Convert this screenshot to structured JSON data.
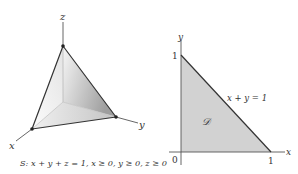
{
  "left_panel": {
    "axis_labels": {
      "x": "x",
      "y": "y",
      "z": "z"
    },
    "caption": "S: x + y + z = 1, x ≥ 0, y ≥ 0, z ≥ 0",
    "surface_name": "S",
    "vertices": {
      "origin": [
        63,
        102
      ],
      "top": [
        63,
        46
      ],
      "x_vertex": [
        32,
        129
      ],
      "y_vertex": [
        116,
        117
      ]
    }
  },
  "right_panel": {
    "axis_labels": {
      "x": "x",
      "y": "y"
    },
    "tick_labels": {
      "origin": "0",
      "x_one": "1",
      "y_one": "1"
    },
    "line_label": "x + y = 1",
    "region_label": "𝒟"
  },
  "colors": {
    "line": "#333333",
    "axis": "#555555",
    "region_fill": "#d2d2d2",
    "surface_light": "#f4f4f4",
    "surface_dark": "#a8a8a8",
    "inner_edge": "#b8b8b8"
  }
}
